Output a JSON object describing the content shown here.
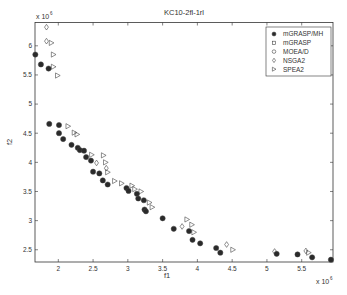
{
  "chart_data": {
    "type": "scatter",
    "title": "KC10-2fl-1rl",
    "xlabel": "f1",
    "ylabel": "f2",
    "x_exponent": "x 10",
    "x_exponent_power": "6",
    "y_exponent": "x 10",
    "y_exponent_power": "6",
    "xlim": [
      1.665,
      5.95
    ],
    "ylim": [
      2.29,
      6.4
    ],
    "xticks": [
      2,
      2.5,
      3,
      3.5,
      4,
      4.5,
      5,
      5.5
    ],
    "xtick_labels": [
      "2",
      "2.5",
      "3",
      "3.5",
      "4",
      "4.5",
      "5",
      "5.5"
    ],
    "yticks": [
      2.5,
      3,
      3.5,
      4,
      4.5,
      5,
      5.5,
      6
    ],
    "ytick_labels": [
      "2.5",
      "3",
      "3.5",
      "4",
      "4.5",
      "5",
      "5.5",
      "6"
    ],
    "grid": false,
    "legend_position": "upper right",
    "series": [
      {
        "name": "mGRASP/MH",
        "marker": "filled-circle",
        "x": [
          1.67,
          1.75,
          1.86,
          1.87,
          2.01,
          2.01,
          2.07,
          2.19,
          2.28,
          2.31,
          2.37,
          2.4,
          2.47,
          2.5,
          2.59,
          2.64,
          2.71,
          2.98,
          3.01,
          3.13,
          3.15,
          3.23,
          3.24,
          3.26,
          3.5,
          3.66,
          3.88,
          3.93,
          4.04,
          4.27,
          4.33,
          5.14,
          5.44,
          5.65,
          5.92
        ],
        "y": [
          5.85,
          5.68,
          5.61,
          4.66,
          4.64,
          4.5,
          4.4,
          4.3,
          4.25,
          4.21,
          4.2,
          4.09,
          4.03,
          3.84,
          3.81,
          3.69,
          3.62,
          3.56,
          3.51,
          3.46,
          3.38,
          3.35,
          3.19,
          3.16,
          3.04,
          2.86,
          2.82,
          2.67,
          2.61,
          2.53,
          2.45,
          2.43,
          2.42,
          2.37,
          2.33
        ]
      },
      {
        "name": "mGRASP",
        "marker": "square",
        "x": [],
        "y": []
      },
      {
        "name": "MOEA/D",
        "marker": "circle",
        "x": [],
        "y": []
      },
      {
        "name": "NSGA2",
        "marker": "diamond",
        "x": [
          1.83,
          1.83,
          2.55,
          2.69,
          3.78,
          4.42,
          5.11,
          5.56
        ],
        "y": [
          6.32,
          6.08,
          3.99,
          3.9,
          2.9,
          2.59,
          2.47,
          2.48
        ]
      },
      {
        "name": "SPEA2",
        "marker": "triangle-right",
        "x": [
          1.9,
          1.93,
          1.93,
          1.99,
          2.14,
          2.23,
          2.27,
          2.48,
          2.65,
          2.68,
          2.71,
          2.81,
          2.91,
          3.06,
          3.1,
          3.19,
          3.31,
          3.35,
          3.85,
          3.92,
          3.95,
          4.51,
          5.6
        ],
        "y": [
          6.05,
          5.85,
          5.64,
          5.49,
          4.62,
          4.51,
          4.48,
          4.13,
          4.12,
          4.0,
          3.83,
          3.68,
          3.64,
          3.6,
          3.54,
          3.5,
          3.31,
          3.23,
          3.02,
          2.93,
          2.8,
          2.5,
          2.45
        ]
      }
    ]
  },
  "legend": {
    "items": [
      {
        "label": "mGRASP/MH",
        "marker": "filled-circle"
      },
      {
        "label": "mGRASP",
        "marker": "square"
      },
      {
        "label": "MOEA/D",
        "marker": "circle"
      },
      {
        "label": "NSGA2",
        "marker": "diamond"
      },
      {
        "label": "SPEA2",
        "marker": "triangle-right"
      }
    ]
  },
  "colors": {
    "axis": "#333333",
    "marker_fill": "#2a2a2a",
    "marker_stroke": "#444444",
    "background": "#ffffff"
  }
}
